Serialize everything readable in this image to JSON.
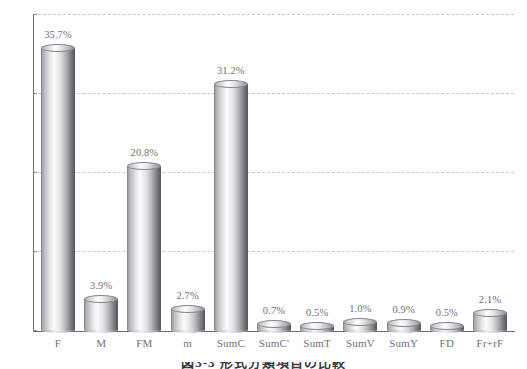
{
  "chart_data": {
    "type": "bar",
    "title": "",
    "xlabel": "",
    "ylabel": "",
    "ylim": [
      0,
      40
    ],
    "grid": true,
    "legend": "none",
    "ytick_labels": [
      "0%",
      "10%",
      "20%",
      "30%",
      "40%"
    ],
    "ytick_values": [
      0,
      10,
      20,
      30,
      40
    ],
    "categories": [
      "F",
      "M",
      "FM",
      "m",
      "SumC",
      "SumC'",
      "SumT",
      "SumV",
      "SumY",
      "FD",
      "Fr+rF"
    ],
    "values": [
      35.7,
      3.9,
      20.8,
      2.7,
      31.2,
      0.7,
      0.5,
      1.0,
      0.9,
      0.5,
      2.1
    ],
    "data_labels": [
      "35.7%",
      "3.9%",
      "20.8%",
      "2.7%",
      "31.2%",
      "0.7%",
      "0.5%",
      "1.0%",
      "0.9%",
      "0.5%",
      "2.1%"
    ]
  },
  "caption": {
    "text": "図3-3 形式分類項目の比較"
  },
  "colors": {
    "gridline": "#c9c9cf",
    "axis": "#6d6d72",
    "text": "#6f6f75",
    "bar_light": "#fbfbfc",
    "bar_dark": "#5c5c62"
  }
}
